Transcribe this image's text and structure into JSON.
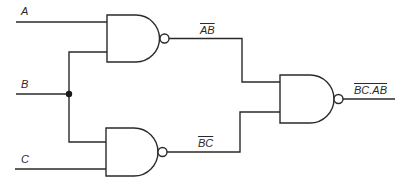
{
  "diagram": {
    "type": "logic-circuit",
    "inputs": [
      {
        "id": "A",
        "label": "A"
      },
      {
        "id": "B",
        "label": "B"
      },
      {
        "id": "C",
        "label": "C"
      }
    ],
    "gates": [
      {
        "id": "nand1",
        "type": "NAND",
        "inputs": [
          "A",
          "B"
        ],
        "output_label": "AB"
      },
      {
        "id": "nand2",
        "type": "NAND",
        "inputs": [
          "B",
          "C"
        ],
        "output_label": "BC"
      },
      {
        "id": "nand3",
        "type": "NAND",
        "inputs": [
          "nand1",
          "nand2"
        ],
        "output_label": "BC.AB"
      }
    ],
    "junctions": [
      {
        "node": "B",
        "description": "B fans out to nand1 and nand2"
      }
    ],
    "labels": {
      "input_a": "A",
      "input_b": "B",
      "input_c": "C",
      "nand1_out": "AB",
      "nand2_out": "BC",
      "final_out": "BC.AB"
    },
    "colors": {
      "line": "#2a2a2a",
      "background": "#ffffff"
    }
  }
}
